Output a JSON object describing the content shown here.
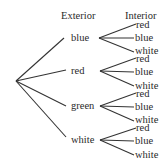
{
  "diagram": {
    "type": "tree-diagram",
    "headers": {
      "exterior": "Exterior",
      "interior": "Interior"
    },
    "exterior": [
      {
        "label": "blue",
        "interior": [
          "red",
          "blue",
          "white"
        ]
      },
      {
        "label": "red",
        "interior": [
          "red",
          "blue",
          "white"
        ]
      },
      {
        "label": "green",
        "interior": [
          "red",
          "blue",
          "white"
        ]
      },
      {
        "label": "white",
        "interior": [
          "red",
          "blue",
          "white"
        ]
      }
    ]
  }
}
